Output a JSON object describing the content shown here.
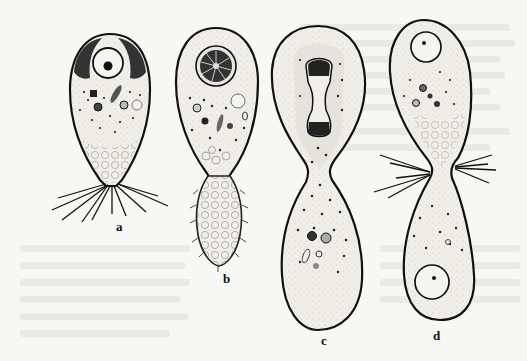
{
  "figure": {
    "panels": [
      {
        "id": "a",
        "label": "a"
      },
      {
        "id": "b",
        "label": "b"
      },
      {
        "id": "c",
        "label": "c"
      },
      {
        "id": "d",
        "label": "d"
      }
    ]
  },
  "colors": {
    "paper": "#f7f7f5",
    "ink": "#111111",
    "cytoplasm": "#ecebe6"
  }
}
